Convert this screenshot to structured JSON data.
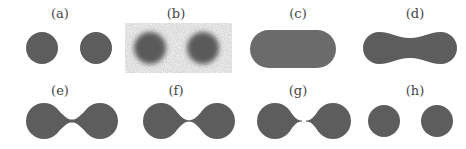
{
  "figure": {
    "fill_color": "#5d5d5d",
    "noise_bg_color": "#e2e2e2",
    "background": "#ffffff",
    "panels": [
      {
        "id": "a",
        "label": "(a)",
        "label_x": 60,
        "label_y": 7,
        "shape": "two-circles",
        "description": "two separate solid disks"
      },
      {
        "id": "b",
        "label": "(b)",
        "label_x": 176,
        "label_y": 7,
        "shape": "noisy-blurred-circles",
        "description": "two blurred disks on noisy background"
      },
      {
        "id": "c",
        "label": "(c)",
        "label_x": 298,
        "label_y": 7,
        "shape": "stadium",
        "description": "single rounded capsule shape"
      },
      {
        "id": "d",
        "label": "(d)",
        "label_x": 415,
        "label_y": 7,
        "shape": "dumbbell-thick",
        "description": "two disks joined by a thick neck"
      },
      {
        "id": "e",
        "label": "(e)",
        "label_x": 60,
        "label_y": 84,
        "shape": "dumbbell-thin",
        "description": "two disks joined by a thin neck"
      },
      {
        "id": "f",
        "label": "(f)",
        "label_x": 176,
        "label_y": 84,
        "shape": "dumbbell-thinner",
        "description": "two disks joined by a very thin neck"
      },
      {
        "id": "g",
        "label": "(g)",
        "label_x": 298,
        "label_y": 84,
        "shape": "pinching",
        "description": "two disks with a pinching neck almost separated"
      },
      {
        "id": "h",
        "label": "(h)",
        "label_x": 415,
        "label_y": 84,
        "shape": "two-circles",
        "description": "two separate solid disks"
      }
    ]
  }
}
